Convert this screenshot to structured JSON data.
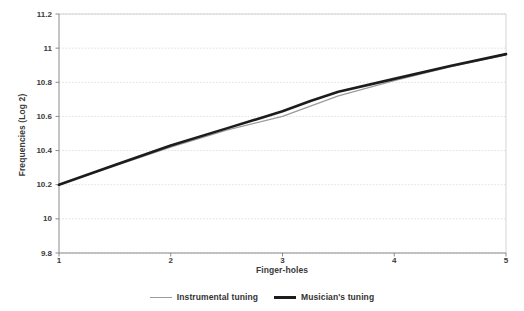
{
  "chart_data": {
    "type": "line",
    "title": "",
    "xlabel": "Finger-holes",
    "ylabel": "Frequencies (Log 2)",
    "xlim": [
      1,
      5
    ],
    "ylim": [
      9.8,
      11.2
    ],
    "xticks": [
      "1",
      "2",
      "3",
      "4",
      "5"
    ],
    "yticks": [
      "11.2",
      "11",
      "10.8",
      "10.6",
      "10.4",
      "10.2",
      "10",
      "9.8"
    ],
    "ytick_values": [
      11.2,
      11.0,
      10.8,
      10.6,
      10.4,
      10.2,
      10.0,
      9.8
    ],
    "xtick_values": [
      1,
      2,
      3,
      4,
      5
    ],
    "grid": true,
    "grid_axis": "y",
    "legend_position": "bottom",
    "x": [
      1,
      1.5,
      2,
      2.5,
      3,
      3.25,
      3.5,
      4,
      4.5,
      5
    ],
    "series": [
      {
        "name": "Instrumental tuning",
        "color": "#9b9b9b",
        "linewidth": 1.3,
        "values": [
          10.2,
          10.31,
          10.42,
          10.52,
          10.6,
          10.66,
          10.72,
          10.81,
          10.89,
          10.96
        ]
      },
      {
        "name": "Musician's tuning",
        "color": "#1c1c1c",
        "linewidth": 2.6,
        "values": [
          10.2,
          10.315,
          10.43,
          10.53,
          10.63,
          10.69,
          10.745,
          10.82,
          10.895,
          10.965
        ]
      }
    ]
  },
  "axis": {
    "y_title": "Frequencies (Log 2)",
    "x_title": "Finger-holes"
  },
  "legend": {
    "items": [
      {
        "label": "Instrumental tuning"
      },
      {
        "label": "Musician's tuning"
      }
    ]
  },
  "colors": {
    "instrumental": "#9b9b9b",
    "musician": "#1c1c1c",
    "grid": "#d8d8d8",
    "frame": "#c9c9c9",
    "text": "#3a3a3a",
    "background": "#ffffff"
  }
}
